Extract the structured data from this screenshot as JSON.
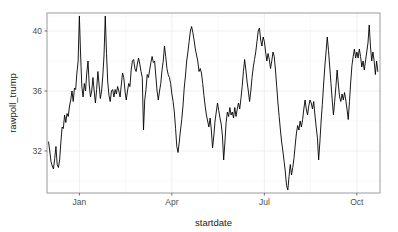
{
  "chart_data": {
    "type": "line",
    "title": "",
    "xlabel": "startdate",
    "ylabel": "rawpoll_trump",
    "ylim": [
      29.2,
      41.2
    ],
    "y_ticks": [
      32,
      36,
      40
    ],
    "y_tick_labels": [
      "32",
      "36",
      "40"
    ],
    "x_ticks": [
      0.5,
      3.5,
      6.5,
      9.5
    ],
    "x_tick_labels": [
      "Jan",
      "Apr",
      "Jul",
      "Oct"
    ],
    "xlim": [
      -0.55,
      10.25
    ],
    "grid": true,
    "grid_color": "#ebebeb",
    "legend": "none",
    "line_color": "#000000",
    "panel_border_color": "#9a9a9a",
    "x_unit": "month_index_from_Dec",
    "x": [
      -0.5,
      -0.46,
      -0.42,
      -0.38,
      -0.34,
      -0.3,
      -0.26,
      -0.22,
      -0.18,
      -0.14,
      -0.1,
      -0.06,
      -0.02,
      0.02,
      0.06,
      0.1,
      0.14,
      0.18,
      0.22,
      0.26,
      0.3,
      0.34,
      0.38,
      0.42,
      0.46,
      0.5,
      0.54,
      0.58,
      0.62,
      0.66,
      0.7,
      0.74,
      0.78,
      0.82,
      0.86,
      0.9,
      0.94,
      0.98,
      1.02,
      1.06,
      1.1,
      1.14,
      1.18,
      1.22,
      1.26,
      1.3,
      1.34,
      1.38,
      1.42,
      1.46,
      1.5,
      1.54,
      1.58,
      1.62,
      1.66,
      1.7,
      1.74,
      1.78,
      1.82,
      1.86,
      1.9,
      1.94,
      1.98,
      2.02,
      2.06,
      2.1,
      2.14,
      2.18,
      2.22,
      2.26,
      2.3,
      2.34,
      2.38,
      2.42,
      2.46,
      2.5,
      2.54,
      2.58,
      2.62,
      2.66,
      2.7,
      2.74,
      2.78,
      2.82,
      2.86,
      2.9,
      2.94,
      2.98,
      3.02,
      3.06,
      3.1,
      3.14,
      3.18,
      3.22,
      3.26,
      3.3,
      3.34,
      3.38,
      3.42,
      3.46,
      3.5,
      3.54,
      3.58,
      3.62,
      3.66,
      3.7,
      3.74,
      3.78,
      3.82,
      3.86,
      3.9,
      3.94,
      3.98,
      4.02,
      4.06,
      4.1,
      4.14,
      4.18,
      4.22,
      4.26,
      4.3,
      4.34,
      4.38,
      4.42,
      4.46,
      4.5,
      4.54,
      4.58,
      4.62,
      4.66,
      4.7,
      4.74,
      4.78,
      4.82,
      4.86,
      4.9,
      4.94,
      4.98,
      5.02,
      5.06,
      5.1,
      5.14,
      5.18,
      5.22,
      5.26,
      5.3,
      5.34,
      5.38,
      5.42,
      5.46,
      5.5,
      5.54,
      5.58,
      5.62,
      5.66,
      5.7,
      5.74,
      5.78,
      5.82,
      5.86,
      5.9,
      5.94,
      5.98,
      6.02,
      6.06,
      6.1,
      6.14,
      6.18,
      6.22,
      6.26,
      6.3,
      6.34,
      6.38,
      6.42,
      6.46,
      6.5,
      6.54,
      6.58,
      6.62,
      6.66,
      6.7,
      6.74,
      6.78,
      6.82,
      6.86,
      6.9,
      6.94,
      6.98,
      7.02,
      7.06,
      7.1,
      7.14,
      7.18,
      7.22,
      7.26,
      7.3,
      7.34,
      7.38,
      7.42,
      7.46,
      7.5,
      7.54,
      7.58,
      7.62,
      7.66,
      7.7,
      7.74,
      7.78,
      7.82,
      7.86,
      7.9,
      7.94,
      7.98,
      8.02,
      8.06,
      8.1,
      8.14,
      8.18,
      8.22,
      8.26,
      8.3,
      8.34,
      8.38,
      8.42,
      8.46,
      8.5,
      8.54,
      8.58,
      8.62,
      8.66,
      8.7,
      8.74,
      8.78,
      8.82,
      8.86,
      8.9,
      8.94,
      8.98,
      9.02,
      9.06,
      9.1,
      9.14,
      9.18,
      9.22,
      9.26,
      9.3,
      9.34,
      9.38,
      9.42,
      9.46,
      9.5,
      9.54,
      9.58,
      9.62,
      9.66,
      9.7,
      9.74,
      9.78,
      9.82,
      9.86,
      9.9,
      9.94,
      9.98,
      10.02,
      10.06,
      10.1,
      10.14,
      10.18
    ],
    "values": [
      32.6,
      32.0,
      31.3,
      31.0,
      30.8,
      31.5,
      32.3,
      31.1,
      30.9,
      31.4,
      32.6,
      33.6,
      33.5,
      34.4,
      33.9,
      34.5,
      34.3,
      35.0,
      35.4,
      36.0,
      35.3,
      36.2,
      36.1,
      37.2,
      38.0,
      41.0,
      38.4,
      36.3,
      35.6,
      36.5,
      36.0,
      37.2,
      38.0,
      36.4,
      35.6,
      36.0,
      36.9,
      36.0,
      35.2,
      36.1,
      37.3,
      36.4,
      35.5,
      36.0,
      37.0,
      38.4,
      41.0,
      38.5,
      36.6,
      35.7,
      35.3,
      36.0,
      36.1,
      35.6,
      36.1,
      35.8,
      36.3,
      36.0,
      35.6,
      36.4,
      37.2,
      36.9,
      36.0,
      35.4,
      36.0,
      36.5,
      36.3,
      37.4,
      38.0,
      38.1,
      37.5,
      37.3,
      37.8,
      38.2,
      37.8,
      37.3,
      36.9,
      33.4,
      35.4,
      36.1,
      37.1,
      36.9,
      37.4,
      37.9,
      38.3,
      37.9,
      38.0,
      37.0,
      36.0,
      35.4,
      36.0,
      36.5,
      37.4,
      38.0,
      39.0,
      38.3,
      37.5,
      37.1,
      36.9,
      36.5,
      35.8,
      35.3,
      34.6,
      33.5,
      32.3,
      31.9,
      32.6,
      33.4,
      34.1,
      35.0,
      36.2,
      37.0,
      38.0,
      38.6,
      39.3,
      40.0,
      40.3,
      39.9,
      39.4,
      38.8,
      38.4,
      38.0,
      37.3,
      37.5,
      37.2,
      36.5,
      35.7,
      35.0,
      34.4,
      34.0,
      33.6,
      34.2,
      33.4,
      32.2,
      33.0,
      34.0,
      34.6,
      35.2,
      34.7,
      34.2,
      33.8,
      33.0,
      31.4,
      32.6,
      33.9,
      34.6,
      34.3,
      34.9,
      34.4,
      34.6,
      34.2,
      34.9,
      34.3,
      34.8,
      35.2,
      34.8,
      35.5,
      36.3,
      37.3,
      38.1,
      37.4,
      36.6,
      36.0,
      35.3,
      36.0,
      36.9,
      37.6,
      38.1,
      38.6,
      39.3,
      40.0,
      40.2,
      39.4,
      39.0,
      39.6,
      39.3,
      38.6,
      38.0,
      38.5,
      38.1,
      37.5,
      38.0,
      38.6,
      38.3,
      37.4,
      36.3,
      35.2,
      34.3,
      33.4,
      32.6,
      32.0,
      31.3,
      30.6,
      29.7,
      29.4,
      30.3,
      31.1,
      30.4,
      30.9,
      31.5,
      32.4,
      33.2,
      33.7,
      33.4,
      34.0,
      33.6,
      34.1,
      34.8,
      35.4,
      34.8,
      34.4,
      35.0,
      35.4,
      35.2,
      34.8,
      35.3,
      34.4,
      33.6,
      32.9,
      31.4,
      32.6,
      34.0,
      35.1,
      36.4,
      37.6,
      38.6,
      39.6,
      38.7,
      37.6,
      36.5,
      35.4,
      34.4,
      35.3,
      36.3,
      37.4,
      36.4,
      35.6,
      35.3,
      35.8,
      35.4,
      35.9,
      35.4,
      34.8,
      34.1,
      35.3,
      36.6,
      37.7,
      38.3,
      38.8,
      38.2,
      38.6,
      38.2,
      38.8,
      38.3,
      37.6,
      38.0,
      37.4,
      38.0,
      38.6,
      39.2,
      40.4,
      39.0,
      38.0,
      38.6,
      38.0,
      37.1,
      38.0,
      37.3
    ],
    "values_tail": [
      36.9,
      37.4,
      36.8,
      37.3,
      36.3,
      36.4,
      37.0,
      36.6,
      37.2,
      36.5,
      37.0,
      38.0,
      37.5,
      36.7,
      37.3,
      38.4,
      37.6,
      36.8,
      37.2,
      36.6,
      37.4,
      36.7,
      36.1,
      36.2,
      37.0,
      36.4,
      37.2,
      36.9,
      37.5,
      38.0,
      37.4,
      37.0,
      37.6,
      38.1,
      37.2,
      36.6,
      37.4,
      36.2,
      35.8,
      36.8,
      37.6,
      37.0,
      37.4,
      38.0,
      37.2,
      36.9,
      37.6,
      39.1
    ]
  }
}
